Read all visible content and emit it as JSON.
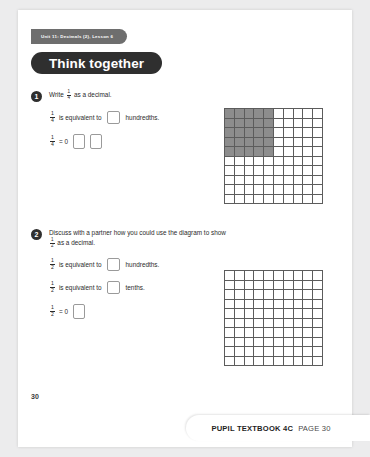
{
  "header": {
    "unit_tab": "Unit 11: Decimals (2), Lesson 6",
    "section_banner": "Think together"
  },
  "questions": [
    {
      "number": "1",
      "stem": "Write      as a decimal.",
      "stem_prefix": "Write",
      "stem_suffix": "as a decimal.",
      "fraction": {
        "numerator": "1",
        "denominator": "4"
      },
      "lines": [
        {
          "fraction": {
            "numerator": "1",
            "denominator": "4"
          },
          "text_before": "is equivalent to",
          "boxes": 1,
          "text_after": "hundredths."
        },
        {
          "fraction": {
            "numerator": "1",
            "denominator": "4"
          },
          "text_before": "= 0",
          "boxes": 2,
          "text_after": ""
        }
      ]
    },
    {
      "number": "2",
      "stem_prefix": "Discuss with a partner how you could use the diagram to show",
      "stem_suffix": "as a decimal.",
      "fraction": {
        "numerator": "1",
        "denominator": "2"
      },
      "lines": [
        {
          "fraction": {
            "numerator": "1",
            "denominator": "2"
          },
          "text_before": "is equivalent to",
          "boxes": 1,
          "text_after": "hundredths."
        },
        {
          "fraction": {
            "numerator": "1",
            "denominator": "2"
          },
          "text_before": "is equivalent to",
          "boxes": 1,
          "text_after": "tenths."
        },
        {
          "fraction": {
            "numerator": "1",
            "denominator": "2"
          },
          "text_before": "= 0",
          "boxes": 1,
          "text_after": ""
        }
      ]
    }
  ],
  "grids": [
    {
      "name": "hundred-square-shaded",
      "rows": 10,
      "columns": 10,
      "shaded_rows": 5,
      "shaded_columns": 5,
      "shaded_cells": 25,
      "shade_color": "#8d8d8d",
      "line_color": "#5c5c5c"
    },
    {
      "name": "hundred-square-blank",
      "rows": 10,
      "columns": 10,
      "shaded_rows": 0,
      "shaded_columns": 0,
      "shaded_cells": 0,
      "shade_color": "#8d8d8d",
      "line_color": "#5c5c5c"
    }
  ],
  "page_number": "30",
  "footer": {
    "title": "PUPIL TEXTBOOK 4C",
    "page_label": "PAGE 30"
  }
}
